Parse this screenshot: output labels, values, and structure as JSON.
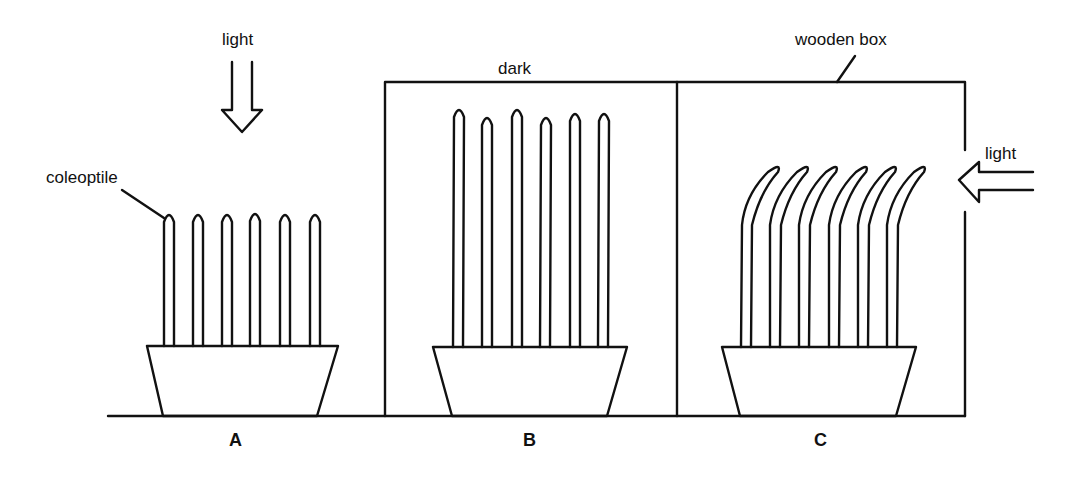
{
  "diagram": {
    "type": "plant phototropism experiment",
    "labels": {
      "light_top": "light",
      "coleoptile": "coleoptile",
      "dark": "dark",
      "wooden_box": "wooden box",
      "light_side": "light"
    },
    "panels": [
      {
        "id": "A",
        "caption": "A",
        "condition": "light from above",
        "coleoptile_count": 6,
        "growth": "straight, short"
      },
      {
        "id": "B",
        "caption": "B",
        "condition": "dark",
        "coleoptile_count": 6,
        "growth": "straight, tall"
      },
      {
        "id": "C",
        "caption": "C",
        "condition": "light from side",
        "coleoptile_count": 6,
        "growth": "bent toward light"
      }
    ],
    "colors": {
      "stroke": "#111111",
      "background": "#ffffff"
    }
  }
}
